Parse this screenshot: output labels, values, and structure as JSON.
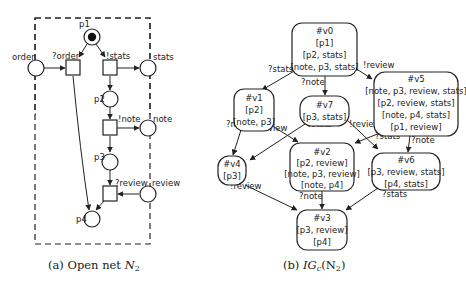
{
  "figure_a": {
    "caption_prefix": "(a) Open net ",
    "caption_math": "N",
    "caption_sub": "2",
    "places": {
      "p1": "p1",
      "p2": "p2",
      "p3": "p3",
      "p4": "p4",
      "order": "order",
      "stats": "stats",
      "note": "note",
      "review": "review"
    },
    "transitions": {
      "t_order": "?order",
      "t_stats": "!stats",
      "t_note": "!note",
      "t_review": "?review"
    }
  },
  "figure_b": {
    "caption_prefix": "(b) ",
    "caption_math": "IG",
    "caption_sub": "c",
    "caption_arg": "(N",
    "caption_arg_sub": "2",
    "caption_close": ")",
    "nodes": {
      "v0": {
        "id": "#v0",
        "lines": [
          "[p1]",
          "[p2, stats]",
          "[note, p3, stats]"
        ]
      },
      "v1": {
        "id": "#v1",
        "lines": [
          "[p2]",
          "[note, p3]"
        ]
      },
      "v7": {
        "id": "#v7",
        "lines": [
          "[p3, stats]"
        ]
      },
      "v5": {
        "id": "#v5",
        "lines": [
          "[note, p3, review, stats]",
          "[p2, review, stats]",
          "[note, p4, stats]",
          "[p1, review]"
        ]
      },
      "v4": {
        "id": "#v4",
        "lines": [
          "[p3]"
        ]
      },
      "v2": {
        "id": "#v2",
        "lines": [
          "[p2, review]",
          "[note, p3, review]",
          "[note, p4]"
        ]
      },
      "v6": {
        "id": "#v6",
        "lines": [
          "[p3, review, stats]",
          "[p4, stats]"
        ]
      },
      "v3": {
        "id": "#v3",
        "lines": [
          "[p3, review]",
          "[p4]"
        ]
      }
    },
    "edges": {
      "v0_v1": "?stats",
      "v0_v7": "?note",
      "v0_v5": "!review",
      "v1_v4": "?note",
      "v1_v2": "!review",
      "v7_v4": "?stats",
      "v7_v6": "!review",
      "v5_v2": "?stats",
      "v5_v6": "?note",
      "v4_v3": "!review",
      "v2_v3": "?note",
      "v6_v3": "?stats"
    }
  }
}
